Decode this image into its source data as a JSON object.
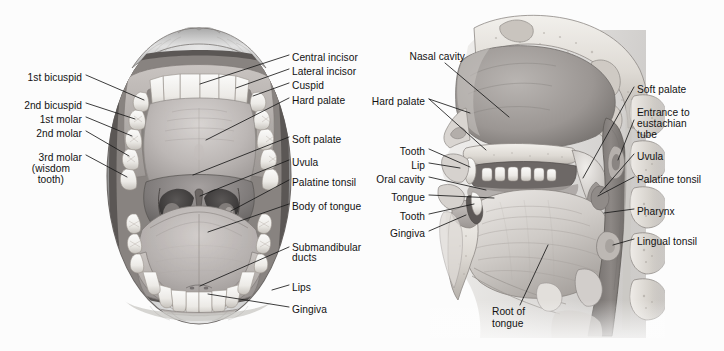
{
  "figure": {
    "type": "anatomical-illustration",
    "style": "grayscale-pencil-rendering",
    "background_color": "#fcfcfc",
    "label_color": "#121212",
    "leader_line_color": "#1a1a1a",
    "panels": [
      {
        "id": "anterior-oral-cavity",
        "title_shown": "",
        "view": "anterior view of open mouth"
      },
      {
        "id": "sagittal-head-section",
        "title_shown": "",
        "view": "mid-sagittal section of head and neck"
      }
    ]
  },
  "left_panel": {
    "labels_left": [
      {
        "text": "1st bicuspid",
        "x": 82,
        "y": 78,
        "align": "right"
      },
      {
        "text": "2nd bicuspid",
        "x": 82,
        "y": 106,
        "align": "right"
      },
      {
        "text": "1st molar",
        "x": 82,
        "y": 120,
        "align": "right"
      },
      {
        "text": "2nd molar",
        "x": 82,
        "y": 134,
        "align": "right"
      },
      {
        "text": "3rd molar",
        "x": 82,
        "y": 158,
        "align": "right"
      },
      {
        "text": "(wisdom",
        "x": 70,
        "y": 169,
        "align": "right"
      },
      {
        "text": "tooth)",
        "x": 64,
        "y": 180,
        "align": "right"
      }
    ],
    "labels_right": [
      {
        "text": "Central incisor",
        "x": 292,
        "y": 58,
        "align": "left"
      },
      {
        "text": "Lateral incisor",
        "x": 292,
        "y": 72,
        "align": "left"
      },
      {
        "text": "Cuspid",
        "x": 292,
        "y": 86,
        "align": "left"
      },
      {
        "text": "Hard palate",
        "x": 292,
        "y": 101,
        "align": "left"
      },
      {
        "text": "Soft palate",
        "x": 292,
        "y": 140,
        "align": "left"
      },
      {
        "text": "Uvula",
        "x": 292,
        "y": 163,
        "align": "left"
      },
      {
        "text": "Palatine tonsil",
        "x": 292,
        "y": 183,
        "align": "left"
      },
      {
        "text": "Body of tongue",
        "x": 292,
        "y": 207,
        "align": "left"
      },
      {
        "text": "Submandibular",
        "x": 292,
        "y": 248,
        "align": "left"
      },
      {
        "text": "ducts",
        "x": 292,
        "y": 258,
        "align": "left"
      },
      {
        "text": "Lips",
        "x": 292,
        "y": 288,
        "align": "left"
      },
      {
        "text": "Gingiva",
        "x": 292,
        "y": 310,
        "align": "left"
      }
    ]
  },
  "right_panel": {
    "labels_left": [
      {
        "text": "Nasal cavity",
        "x": 465,
        "y": 57,
        "align": "right"
      },
      {
        "text": "Hard palate",
        "x": 425,
        "y": 102,
        "align": "right"
      },
      {
        "text": "Tooth",
        "x": 425,
        "y": 152,
        "align": "right"
      },
      {
        "text": "Lip",
        "x": 425,
        "y": 166,
        "align": "right"
      },
      {
        "text": "Oral cavity",
        "x": 425,
        "y": 180,
        "align": "right"
      },
      {
        "text": "Tongue",
        "x": 425,
        "y": 198,
        "align": "right"
      },
      {
        "text": "Tooth",
        "x": 425,
        "y": 217,
        "align": "right"
      },
      {
        "text": "Gingiva",
        "x": 425,
        "y": 234,
        "align": "right"
      },
      {
        "text": "Root of",
        "x": 492,
        "y": 312,
        "align": "left"
      },
      {
        "text": "tongue",
        "x": 492,
        "y": 324,
        "align": "left"
      }
    ],
    "labels_right": [
      {
        "text": "Soft palate",
        "x": 637,
        "y": 90,
        "align": "left"
      },
      {
        "text": "Entrance to",
        "x": 637,
        "y": 113,
        "align": "left"
      },
      {
        "text": "eustachian",
        "x": 637,
        "y": 124,
        "align": "left"
      },
      {
        "text": "tube",
        "x": 637,
        "y": 135,
        "align": "left"
      },
      {
        "text": "Uvula",
        "x": 637,
        "y": 157,
        "align": "left"
      },
      {
        "text": "Palatine tonsil",
        "x": 637,
        "y": 180,
        "align": "left"
      },
      {
        "text": "Pharynx",
        "x": 637,
        "y": 212,
        "align": "left"
      },
      {
        "text": "Lingual tonsil",
        "x": 637,
        "y": 242,
        "align": "left"
      }
    ]
  }
}
